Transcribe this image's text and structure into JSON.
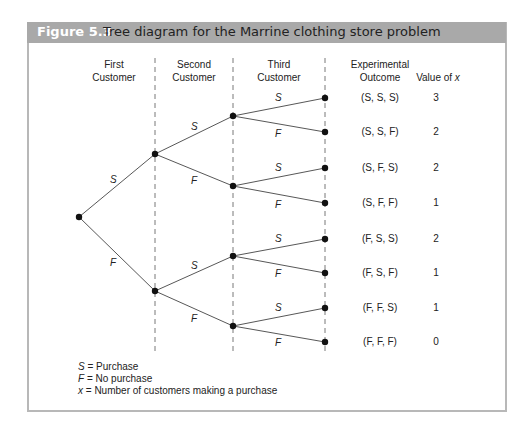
{
  "figure": {
    "number": "Figure 5.3",
    "title": "Tree diagram for the Marrine clothing store problem"
  },
  "columns": {
    "first": [
      "First",
      "Customer"
    ],
    "second": [
      "Second",
      "Customer"
    ],
    "third": [
      "Third",
      "Customer"
    ],
    "outcome": [
      "Experimental",
      "Outcome"
    ],
    "value": "Value of ",
    "value_var": "x"
  },
  "branches": {
    "level1": [
      {
        "label": "S"
      },
      {
        "label": "F"
      }
    ],
    "level2": [
      {
        "label": "S"
      },
      {
        "label": "F"
      },
      {
        "label": "S"
      },
      {
        "label": "F"
      }
    ],
    "level3": [
      {
        "label": "S"
      },
      {
        "label": "F"
      },
      {
        "label": "S"
      },
      {
        "label": "F"
      },
      {
        "label": "S"
      },
      {
        "label": "F"
      },
      {
        "label": "S"
      },
      {
        "label": "F"
      }
    ]
  },
  "outcomes": [
    {
      "outcome": "(S, S, S)",
      "value": "3"
    },
    {
      "outcome": "(S, S, F)",
      "value": "2"
    },
    {
      "outcome": "(S, F, S)",
      "value": "2"
    },
    {
      "outcome": "(S, F, F)",
      "value": "1"
    },
    {
      "outcome": "(F, S, S)",
      "value": "2"
    },
    {
      "outcome": "(F, S, F)",
      "value": "1"
    },
    {
      "outcome": "(F, F, S)",
      "value": "1"
    },
    {
      "outcome": "(F, F, F)",
      "value": "0"
    }
  ],
  "legend": [
    {
      "symbol": "S",
      "text": " = Purchase"
    },
    {
      "symbol": "F",
      "text": " = No purchase"
    },
    {
      "symbol": "x",
      "text": " = Number of customers making a purchase"
    }
  ]
}
